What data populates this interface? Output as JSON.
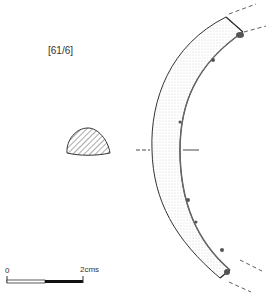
{
  "figure": {
    "catalog_label": "[61/6]",
    "scale_bar": {
      "start_label": "0",
      "end_label": "2cms"
    },
    "colors": {
      "ink": "#333333",
      "shade": "#777777",
      "background": "#ffffff"
    }
  }
}
